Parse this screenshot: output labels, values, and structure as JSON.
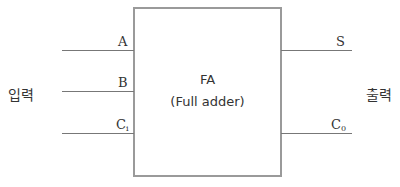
{
  "block": {
    "name": "FA",
    "full_name": "(Full adder)"
  },
  "inputs": {
    "group_label": "입력",
    "pins": [
      {
        "label": "A",
        "subscript": ""
      },
      {
        "label": "B",
        "subscript": ""
      },
      {
        "label": "C",
        "subscript": "i"
      }
    ]
  },
  "outputs": {
    "group_label": "출력",
    "pins": [
      {
        "label": "S",
        "subscript": ""
      },
      {
        "label": "C",
        "subscript": "0"
      }
    ]
  },
  "colors": {
    "box_border": "#9a9a9a",
    "wire": "#777777",
    "text": "#333333"
  }
}
